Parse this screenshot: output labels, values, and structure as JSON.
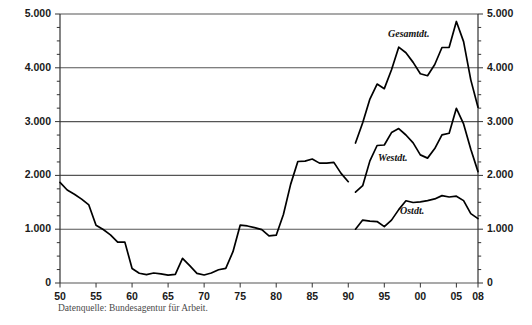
{
  "chart_data": {
    "type": "line",
    "title": "",
    "xlabel": "",
    "ylabel": "",
    "xlim": [
      1950,
      2008
    ],
    "ylim": [
      0,
      5000
    ],
    "grid": true,
    "legend_position": "inline-annotations",
    "y_ticks": [
      "0",
      "1.000",
      "2.000",
      "3.000",
      "4.000",
      "5.000"
    ],
    "y_tick_values": [
      0,
      1000,
      2000,
      3000,
      4000,
      5000
    ],
    "y_minor_step": 250,
    "x_ticks": [
      "50",
      "55",
      "60",
      "65",
      "70",
      "75",
      "80",
      "85",
      "90",
      "95",
      "00",
      "05",
      "08"
    ],
    "x_tick_values": [
      1950,
      1955,
      1960,
      1965,
      1970,
      1975,
      1980,
      1985,
      1990,
      1995,
      2000,
      2005,
      2008
    ],
    "axis_right_ticks": [
      "0",
      "1.000",
      "2.000",
      "3.000",
      "4.000",
      "5.000"
    ],
    "series": [
      {
        "name": "Westdeutschland (1950-1990)",
        "label": "",
        "x": [
          1950,
          1951,
          1952,
          1953,
          1954,
          1955,
          1956,
          1957,
          1958,
          1959,
          1960,
          1961,
          1962,
          1963,
          1964,
          1965,
          1966,
          1967,
          1968,
          1969,
          1970,
          1971,
          1972,
          1973,
          1974,
          1975,
          1976,
          1977,
          1978,
          1979,
          1980,
          1981,
          1982,
          1983,
          1984,
          1985,
          1986,
          1987,
          1988,
          1989,
          1990
        ],
        "y": [
          1869,
          1728,
          1651,
          1559,
          1451,
          1074,
          994,
          895,
          760,
          760,
          271,
          181,
          155,
          186,
          169,
          147,
          161,
          459,
          323,
          179,
          149,
          185,
          246,
          273,
          582,
          1074,
          1060,
          1030,
          993,
          876,
          889,
          1272,
          1833,
          2258,
          2266,
          2304,
          2228,
          2229,
          2242,
          2038,
          1883
        ]
      },
      {
        "name": "Gesamtdt.",
        "label": "Gesamtdt.",
        "x": [
          1991,
          1992,
          1993,
          1994,
          1995,
          1996,
          1997,
          1998,
          1999,
          2000,
          2001,
          2002,
          2003,
          2004,
          2005,
          2006,
          2007,
          2008
        ],
        "y": [
          2602,
          2979,
          3419,
          3698,
          3612,
          3965,
          4384,
          4279,
          4101,
          3889,
          3853,
          4061,
          4377,
          4381,
          4861,
          4487,
          3776,
          3268
        ]
      },
      {
        "name": "Westdt.",
        "label": "Westdt.",
        "x": [
          1991,
          1992,
          1993,
          1994,
          1995,
          1996,
          1997,
          1998,
          1999,
          2000,
          2001,
          2002,
          2003,
          2004,
          2005,
          2006,
          2007,
          2008
        ],
        "y": [
          1689,
          1808,
          2270,
          2556,
          2565,
          2796,
          2870,
          2751,
          2605,
          2381,
          2321,
          2498,
          2753,
          2783,
          3247,
          2956,
          2486,
          2070
        ]
      },
      {
        "name": "Ostdt.",
        "label": "Ostdt.",
        "x": [
          1991,
          1992,
          1993,
          1994,
          1995,
          1996,
          1997,
          1998,
          1999,
          2000,
          2001,
          2002,
          2003,
          2004,
          2005,
          2006,
          2007,
          2008
        ],
        "y": [
          1000,
          1170,
          1149,
          1142,
          1047,
          1169,
          1364,
          1528,
          1496,
          1508,
          1532,
          1563,
          1624,
          1599,
          1614,
          1531,
          1290,
          1197
        ]
      }
    ]
  },
  "annotations": {
    "gesamtdt": "Gesamtdt.",
    "westdt": "Westdt.",
    "ostdt": "Ostdt."
  },
  "source": {
    "note": "Datenquelle: Bundesagentur für Arbeit."
  },
  "colors": {
    "line": "#000000",
    "grid": "#555555",
    "axis": "#333333",
    "background": "#ffffff",
    "source_text": "#4a4a4a"
  }
}
